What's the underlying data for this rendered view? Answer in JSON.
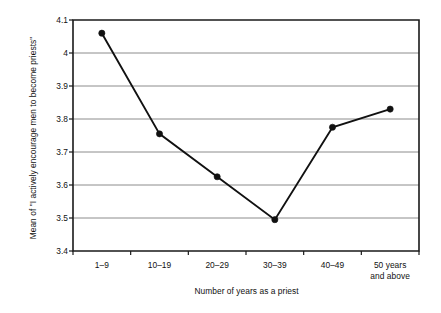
{
  "chart_data": {
    "type": "line",
    "title": "",
    "xlabel": "Number of years as a priest",
    "ylabel": "Mean of \"I actively encourage men to become priests\"",
    "categories": [
      "1–9",
      "10–19",
      "20–29",
      "30–39",
      "40–49",
      "50 years\nand above"
    ],
    "values": [
      4.06,
      3.755,
      3.625,
      3.495,
      3.775,
      3.83
    ],
    "ylim": [
      3.4,
      4.1
    ],
    "ytick_values": [
      3.4,
      3.5,
      3.6,
      3.7,
      3.8,
      3.9,
      4.0,
      4.1
    ],
    "ytick_labels": [
      "3.4",
      "3.5",
      "3.6",
      "3.7",
      "3.8",
      "3.9",
      "4",
      "4.1"
    ],
    "grid": true,
    "grid_axis": "y",
    "legend": false,
    "legend_position": "none",
    "series": [
      {
        "name": "Mean of \"I actively encourage men to become priests\"",
        "values": [
          4.06,
          3.755,
          3.625,
          3.495,
          3.775,
          3.83
        ],
        "line_color": "#111111",
        "marker": "circle",
        "marker_color": "#111111"
      }
    ],
    "colors": {
      "line": "#111111",
      "marker": "#111111",
      "grid": "#8c8c8c",
      "axis": "#1a1a1a",
      "background": "#ffffff",
      "text": "#111111"
    }
  },
  "plot_geometry": {
    "left": 73,
    "right": 419,
    "top": 20,
    "bottom": 251
  }
}
